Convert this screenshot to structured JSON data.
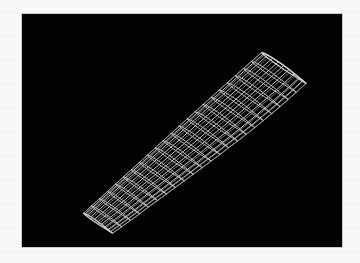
{
  "page": {
    "background_color": "#f9f9f9",
    "border_color": "#c9c9c9"
  },
  "viewport": {
    "title": "3D Wireframe Viewport",
    "background_color": "#030303",
    "wireframe_color": "#cfcfcf",
    "wireframe_color_dim": "#8a8a8a",
    "x": 21,
    "y": 13,
    "width": 322,
    "height": 235
  },
  "model": {
    "name": "aircraft-wing",
    "label": "Swept Aircraft Wing Wireframe",
    "render_mode": "wireframe",
    "shading": "none",
    "projection": "perspective",
    "rib_count": 22,
    "spar_count": 9,
    "tip_point": [
      80,
      212
    ],
    "root_point": [
      262,
      52
    ],
    "sweep_direction": "lower-left to upper-right"
  },
  "geometry": {
    "comment": "Normalized model-space control data used to rebuild the wing mesh. Span runs 0 (tip) to 1 (root).",
    "span_stations": [
      0.0,
      0.045,
      0.09,
      0.135,
      0.18,
      0.225,
      0.27,
      0.315,
      0.36,
      0.405,
      0.45,
      0.495,
      0.54,
      0.585,
      0.63,
      0.675,
      0.72,
      0.765,
      0.81,
      0.855,
      0.9,
      0.945,
      1.0
    ],
    "chord_fractions": [
      0.0,
      0.06,
      0.14,
      0.25,
      0.38,
      0.5,
      0.62,
      0.74,
      0.85,
      0.93,
      1.0
    ],
    "chord_taper": [
      0.56,
      0.585,
      0.61,
      0.635,
      0.655,
      0.68,
      0.705,
      0.73,
      0.755,
      0.78,
      0.805,
      0.83,
      0.855,
      0.875,
      0.9,
      0.92,
      0.94,
      0.955,
      0.97,
      0.982,
      0.99,
      0.997,
      1.0
    ],
    "airfoil_upper": [
      0.0,
      0.03,
      0.048,
      0.062,
      0.068,
      0.066,
      0.058,
      0.046,
      0.03,
      0.016,
      0.0
    ],
    "airfoil_lower": [
      0.0,
      -0.018,
      -0.028,
      -0.034,
      -0.034,
      -0.031,
      -0.026,
      -0.019,
      -0.012,
      -0.005,
      0.0
    ],
    "screen": {
      "tip_x": 80,
      "tip_y": 212,
      "root_x": 262,
      "root_y": 52,
      "chord_vec_x": 52,
      "chord_vec_y": 36,
      "thickness_scale": 44
    }
  }
}
